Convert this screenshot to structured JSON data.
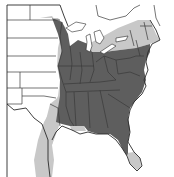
{
  "map": {
    "type": "species-range-map",
    "region": "Eastern United States",
    "width": 174,
    "height": 177,
    "colors": {
      "background": "#ffffff",
      "core_range": "#5e5e5e",
      "peripheral_range": "#c8c8c8",
      "borders": "#3a3a3a",
      "frame": "#555555",
      "great_lakes": "#ffffff"
    },
    "layers": [
      {
        "name": "peripheral-range",
        "description": "Light gray outer range band along Great Plains, Texas, northern New England, and south Florida"
      },
      {
        "name": "core-range",
        "description": "Dark gray main range covering eastern US from Minnesota/Iowa to the Atlantic and Gulf coasts"
      },
      {
        "name": "state-borders",
        "description": "State boundary lines"
      }
    ],
    "legend": null,
    "title": null
  }
}
